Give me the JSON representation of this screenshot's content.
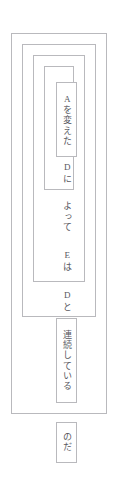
{
  "diagram": {
    "language": "ja",
    "text_direction": "vertical-rl",
    "border_color": "#b9b9bd",
    "text_color": "#585860",
    "background_color": "#ffffff",
    "frames": [
      {
        "name": "outer-frame",
        "level": 1
      },
      {
        "name": "frame-level-2",
        "level": 2
      },
      {
        "name": "frame-level-3",
        "level": 3
      },
      {
        "name": "frame-level-4",
        "level": 4
      }
    ],
    "cells": [
      {
        "name": "cell-a-wo-kaeta",
        "text": "Aを変えた",
        "romaji": "A wo kaeta",
        "depth": 5
      },
      {
        "name": "cell-renzoku-shite-iru",
        "text": "連続している",
        "romaji": "renzoku shite iru",
        "depth": 1
      },
      {
        "name": "cell-noda",
        "text": "のだ",
        "romaji": "no da",
        "depth": 0
      }
    ],
    "labels": [
      {
        "name": "label-d-ni",
        "text": "Dに",
        "romaji": "D ni",
        "depth": 4
      },
      {
        "name": "label-yotte",
        "text": "よって",
        "romaji": "yotte",
        "depth": 4
      },
      {
        "name": "label-e-wa",
        "text": "Eは",
        "romaji": "E wa",
        "depth": 3
      },
      {
        "name": "label-d-to",
        "text": "Dと",
        "romaji": "D to",
        "depth": 2
      }
    ]
  }
}
